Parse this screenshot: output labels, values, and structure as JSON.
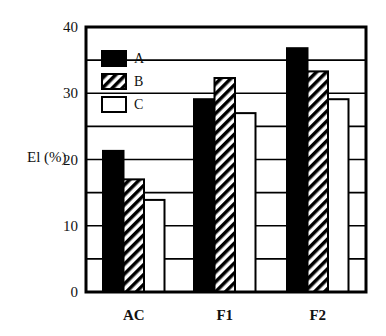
{
  "chart_data": {
    "type": "bar",
    "title": "",
    "xlabel": "",
    "ylabel": "El (%)",
    "ylim": [
      0,
      40
    ],
    "yticks": [
      0,
      10,
      20,
      30,
      40
    ],
    "grid": {
      "horizontal": true,
      "step": 5
    },
    "categories": [
      "AC",
      "F1",
      "F2"
    ],
    "legend_position": "upper-left-inside",
    "series": [
      {
        "name": "A",
        "fill": "solid-black",
        "values": [
          21.3,
          29.1,
          36.8
        ]
      },
      {
        "name": "B",
        "fill": "diagonal-hatch",
        "values": [
          17.0,
          32.3,
          33.3
        ]
      },
      {
        "name": "C",
        "fill": "white",
        "values": [
          13.9,
          27.0,
          29.1
        ]
      }
    ]
  },
  "colors": {
    "black": "#000000",
    "white": "#ffffff"
  }
}
